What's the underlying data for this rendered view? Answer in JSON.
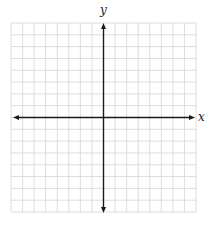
{
  "diagram": {
    "type": "coordinate-plane",
    "grid": {
      "columns": 16,
      "rows": 16,
      "left": 11,
      "top": 23,
      "right": 196,
      "bottom": 212,
      "line_color": "#d4d4d4",
      "line_width": 0.8
    },
    "axes": {
      "origin": {
        "x": 103.5,
        "y": 117.5
      },
      "color": "#1a1a1a",
      "line_width": 1.4,
      "x_axis": {
        "label": "x",
        "from": 13,
        "to": 195,
        "arrows": "both"
      },
      "y_axis": {
        "label": "y",
        "from": 23,
        "to": 213,
        "arrows": "both"
      }
    },
    "cells_left_of_y_axis": 8,
    "cells_right_of_y_axis": 8,
    "cells_above_x_axis": 8,
    "cells_below_x_axis": 8
  },
  "labels": {
    "x_axis": "x",
    "y_axis": "y"
  }
}
